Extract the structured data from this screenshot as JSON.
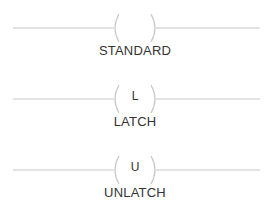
{
  "coils": [
    {
      "symbol": "",
      "label": "STANDARD"
    },
    {
      "symbol": "L",
      "label": "LATCH"
    },
    {
      "symbol": "U",
      "label": "UNLATCH"
    }
  ],
  "colors": {
    "line": "#c8c8c8",
    "text": "#333333"
  }
}
